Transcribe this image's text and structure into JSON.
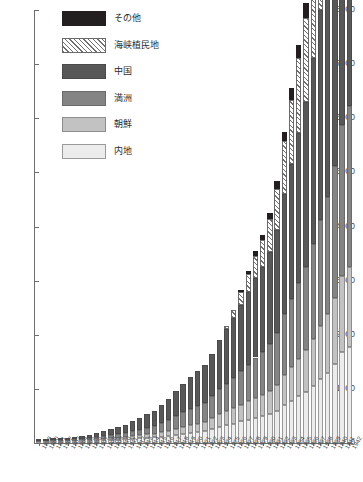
{
  "chart_data": {
    "type": "bar",
    "stacked": true,
    "title": "",
    "xlabel": "",
    "ylabel": "",
    "ylim": [
      0,
      8000
    ],
    "ytick_values": [
      0,
      1000,
      2000,
      3000,
      4000,
      5000,
      6000,
      7000,
      8000
    ],
    "ytick_labels": [
      "0",
      "1000",
      "2000",
      "3000",
      "4000",
      "5000",
      "6000",
      "7000",
      "8000"
    ],
    "grid": false,
    "legend_position": "top-left",
    "categories": [
      "1899",
      "1900",
      "1901",
      "1902",
      "1903",
      "1904",
      "1905",
      "1906",
      "1907",
      "1908",
      "1909",
      "1910",
      "1911",
      "1912",
      "1913",
      "1914",
      "1915",
      "1916",
      "1917",
      "1918",
      "1919",
      "1920",
      "1921",
      "1922",
      "1923",
      "1924",
      "1925",
      "1926",
      "1927",
      "1928",
      "1929",
      "1930",
      "1931",
      "1932",
      "1933",
      "1934",
      "1935",
      "1936",
      "1937",
      "1938",
      "1939",
      "1940",
      "1941",
      "1942"
    ],
    "series": [
      {
        "name": "内地",
        "color": "#ececec",
        "pattern": "solid",
        "values": [
          20,
          22,
          24,
          26,
          30,
          32,
          36,
          40,
          46,
          52,
          58,
          64,
          70,
          78,
          86,
          96,
          104,
          118,
          130,
          150,
          170,
          185,
          200,
          215,
          260,
          300,
          330,
          360,
          400,
          430,
          470,
          500,
          540,
          600,
          700,
          780,
          860,
          940,
          1060,
          1180,
          1300,
          1460,
          1680,
          1780
        ]
      },
      {
        "name": "朝鮮",
        "color": "#c2c2c2",
        "pattern": "solid",
        "values": [
          6,
          8,
          9,
          10,
          12,
          14,
          16,
          18,
          22,
          26,
          30,
          34,
          40,
          46,
          54,
          62,
          70,
          82,
          96,
          112,
          130,
          145,
          160,
          175,
          200,
          230,
          255,
          280,
          310,
          340,
          370,
          395,
          430,
          480,
          560,
          630,
          700,
          770,
          870,
          980,
          1080,
          1220,
          1400,
          1480
        ]
      },
      {
        "name": "満洲",
        "color": "#848484",
        "pattern": "solid",
        "values": [
          10,
          12,
          14,
          16,
          20,
          24,
          28,
          34,
          40,
          48,
          56,
          66,
          78,
          92,
          108,
          126,
          142,
          168,
          196,
          232,
          268,
          296,
          324,
          352,
          400,
          460,
          510,
          560,
          620,
          680,
          740,
          790,
          860,
          960,
          1120,
          1260,
          1400,
          1540,
          1740,
          1960,
          2160,
          2440,
          2800,
          2960
        ]
      },
      {
        "name": "中国",
        "color": "#585858",
        "pattern": "solid",
        "values": [
          14,
          18,
          22,
          26,
          34,
          42,
          52,
          62,
          76,
          92,
          110,
          130,
          154,
          182,
          214,
          250,
          282,
          332,
          388,
          460,
          530,
          586,
          642,
          698,
          790,
          910,
          1010,
          1110,
          1226,
          1344,
          1464,
          1562,
          1700,
          1898,
          2214,
          2492,
          2768,
          3046,
          3440,
          3876,
          4272,
          4824,
          5536,
          5856
        ]
      },
      {
        "name": "海峡植民地",
        "color": "#ffffff",
        "pattern": "diagonal-hatch",
        "values": [
          0,
          0,
          0,
          0,
          0,
          0,
          0,
          0,
          0,
          0,
          0,
          0,
          0,
          0,
          0,
          0,
          0,
          0,
          0,
          0,
          0,
          0,
          0,
          0,
          0,
          0,
          60,
          140,
          230,
          320,
          420,
          500,
          610,
          760,
          980,
          1180,
          1380,
          1560,
          1820,
          2100,
          2380,
          2720,
          3180,
          3380
        ]
      },
      {
        "name": "その他",
        "color": "#231f20",
        "pattern": "solid",
        "values": [
          0,
          0,
          0,
          0,
          0,
          0,
          0,
          0,
          0,
          0,
          0,
          0,
          0,
          0,
          0,
          0,
          0,
          0,
          0,
          0,
          0,
          0,
          0,
          0,
          0,
          0,
          0,
          0,
          40,
          60,
          80,
          90,
          110,
          140,
          180,
          210,
          240,
          270,
          320,
          380,
          430,
          500,
          590,
          640
        ]
      }
    ]
  },
  "legend": {
    "items": [
      {
        "label": "その他",
        "swatch": "sonota-swatch"
      },
      {
        "label": "海峡植民地",
        "swatch": "kaikyo-swatch"
      },
      {
        "label": "中国",
        "swatch": "chugoku-swatch"
      },
      {
        "label": "満洲",
        "swatch": "manshu-swatch"
      },
      {
        "label": "朝鮮",
        "swatch": "chosen-swatch"
      },
      {
        "label": "内地",
        "swatch": "naichi-swatch"
      }
    ]
  },
  "colors": {
    "naichi": "#ececec",
    "chosen": "#c2c2c2",
    "manshu": "#848484",
    "chugoku": "#585858",
    "kaikyo": "#ffffff",
    "sonota": "#231f20",
    "axis": "#6e6e6e",
    "text": "#4a4a4a",
    "background": "#ffffff"
  }
}
